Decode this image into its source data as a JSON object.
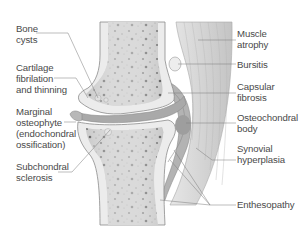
{
  "figure": {
    "colors": {
      "bone_outline": "#8c8c8c",
      "cortex": "#ececec",
      "marrow": "#bdbdbd",
      "cartilage": "#a9a9a9",
      "muscle": "#cfcfcf",
      "leader_line": "#7a7a7a",
      "text": "#4a4a4a"
    }
  },
  "labels": {
    "left": [
      {
        "id": "bone-cysts",
        "text": "Bone\ncysts"
      },
      {
        "id": "cartilage-fibrillation",
        "text": "Cartilage\nfibrilation\nand thinning"
      },
      {
        "id": "marginal-osteophyte",
        "text": "Marginal\nosteophyte\n(endochondral\nossification)"
      },
      {
        "id": "subchondral-sclerosis",
        "text": "Subchondral\nsclerosis"
      }
    ],
    "right": [
      {
        "id": "muscle-atrophy",
        "text": "Muscle\natrophy"
      },
      {
        "id": "bursitis",
        "text": "Bursitis"
      },
      {
        "id": "capsular-fibrosis",
        "text": "Capsular\nfibrosis"
      },
      {
        "id": "osteochondral-body",
        "text": "Osteochondral\nbody"
      },
      {
        "id": "synovial-hyperplasia",
        "text": "Synovial\nhyperplasia"
      },
      {
        "id": "enthesopathy",
        "text": "Enthesopathy"
      }
    ]
  }
}
